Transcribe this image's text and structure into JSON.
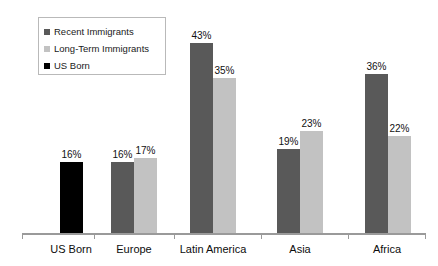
{
  "chart_data": {
    "type": "bar",
    "title": "",
    "subtitle": "",
    "xlabel": "",
    "ylabel": "",
    "ylim": [
      0,
      45
    ],
    "grid": false,
    "legend_position": "top-left",
    "categories": [
      "US Born",
      "Europe",
      "Latin America",
      "Asia",
      "Africa"
    ],
    "series": [
      {
        "name": "Recent Immigrants",
        "color": "#595959",
        "values": [
          null,
          16,
          43,
          19,
          36
        ],
        "labels": [
          "",
          "16%",
          "43%",
          "19%",
          "36%"
        ]
      },
      {
        "name": "Long-Term Immigrants",
        "color": "#c2c2c2",
        "values": [
          null,
          17,
          35,
          23,
          22
        ],
        "labels": [
          "",
          "17%",
          "35%",
          "23%",
          "22%"
        ]
      },
      {
        "name": "US Born",
        "color": "#000000",
        "values": [
          16,
          null,
          null,
          null,
          null
        ],
        "labels": [
          "16%",
          "",
          "",
          "",
          ""
        ]
      }
    ]
  },
  "legend": {
    "items": [
      {
        "label": "Recent Immigrants",
        "swatch": "#595959",
        "icon": "legend-square-icon"
      },
      {
        "label": "Long-Term Immigrants",
        "swatch": "#c2c2c2",
        "icon": "legend-square-icon"
      },
      {
        "label": "US Born",
        "swatch": "#000000",
        "icon": "legend-square-icon"
      }
    ]
  },
  "axis": {
    "categories": [
      "US Born",
      "Europe",
      "Latin America",
      "Asia",
      "Africa"
    ]
  }
}
